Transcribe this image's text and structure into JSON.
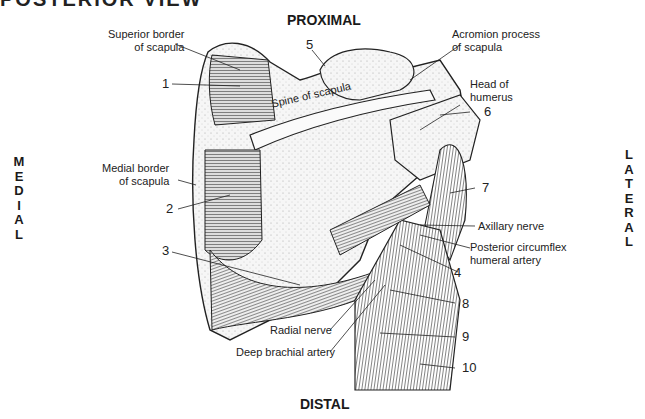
{
  "title": "POSTERIOR VIEW",
  "orientation": {
    "top": "PROXIMAL",
    "bottom": "DISTAL",
    "left": [
      "M",
      "E",
      "D",
      "I",
      "A",
      "L"
    ],
    "right": [
      "L",
      "A",
      "T",
      "E",
      "R",
      "A",
      "L"
    ]
  },
  "labels": {
    "superior_border": [
      "Superior border",
      "of scapula"
    ],
    "acromion": [
      "Acromion process",
      "of scapula"
    ],
    "head_humerus": [
      "Head of",
      "humerus"
    ],
    "spine": "Spine of scapula",
    "medial_border": [
      "Medial border",
      "of scapula"
    ],
    "axillary_nerve": "Axillary nerve",
    "post_circumflex": [
      "Posterior circumflex",
      "humeral artery"
    ],
    "radial_nerve": "Radial nerve",
    "deep_brachial": "Deep brachial artery"
  },
  "numbers": [
    "1",
    "2",
    "3",
    "4",
    "5",
    "6",
    "7",
    "8",
    "9",
    "10"
  ],
  "colors": {
    "ink": "#1a1a1a",
    "bone": "#f4f4f4",
    "muscle": "#e2e2e2"
  }
}
